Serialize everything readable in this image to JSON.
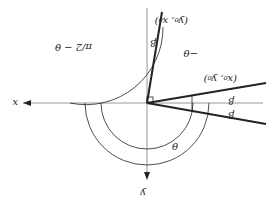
{
  "diagram": {
    "orientation": "rotated 180 degrees",
    "axes": {
      "x_label": "x",
      "y_label": "y"
    },
    "points": {
      "p1": "(x₀, y₀)",
      "p2": "(y₀, x₀)"
    },
    "angles": {
      "theta": "θ",
      "minus_theta": "−θ",
      "beta_upper": "β",
      "beta_lower": "β",
      "beta_rotated": "β",
      "pi_over_2_minus_theta": "π/2 − θ"
    },
    "colors": {
      "line": "#222222",
      "axis": "#888888"
    }
  }
}
